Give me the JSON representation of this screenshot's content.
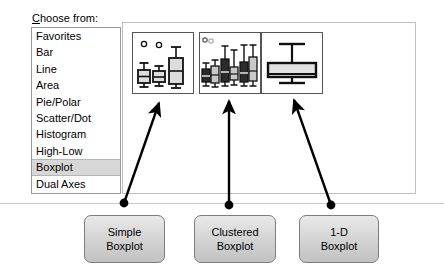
{
  "chooser": {
    "label_first": "C",
    "label_rest": "hoose from:",
    "label_full": "Choose from:"
  },
  "list": {
    "name": "chart-type-list",
    "selected": "Boxplot",
    "items": [
      {
        "label": "Favorites",
        "selected": false
      },
      {
        "label": "Bar",
        "selected": false
      },
      {
        "label": "Line",
        "selected": false
      },
      {
        "label": "Area",
        "selected": false
      },
      {
        "label": "Pie/Polar",
        "selected": false
      },
      {
        "label": "Scatter/Dot",
        "selected": false
      },
      {
        "label": "Histogram",
        "selected": false
      },
      {
        "label": "High-Low",
        "selected": false
      },
      {
        "label": "Boxplot",
        "selected": true
      },
      {
        "label": "Dual Axes",
        "selected": false
      }
    ]
  },
  "gallery": {
    "name": "chart-gallery",
    "thumbnails": [
      {
        "name": "simple-boxplot-thumbnail",
        "type": "simple"
      },
      {
        "name": "clustered-boxplot-thumbnail",
        "type": "clustered"
      },
      {
        "name": "one-d-boxplot-thumbnail",
        "type": "1d"
      }
    ]
  },
  "callouts": [
    {
      "name": "callout-simple-boxplot",
      "line1": "Simple",
      "line2": "Boxplot"
    },
    {
      "name": "callout-clustered-boxplot",
      "line1": "Clustered",
      "line2": "Boxplot"
    },
    {
      "name": "callout-1d-boxplot",
      "line1": "1-D",
      "line2": "Boxplot"
    }
  ],
  "colors": {
    "selection": "#d7d7d7",
    "callout_fill": "#d2d2d2",
    "panel_border": "#bfbfbf",
    "ink": "#000000",
    "light_box_fill": "#dcdcdc",
    "dark_box_fill": "#2b2b2b"
  }
}
